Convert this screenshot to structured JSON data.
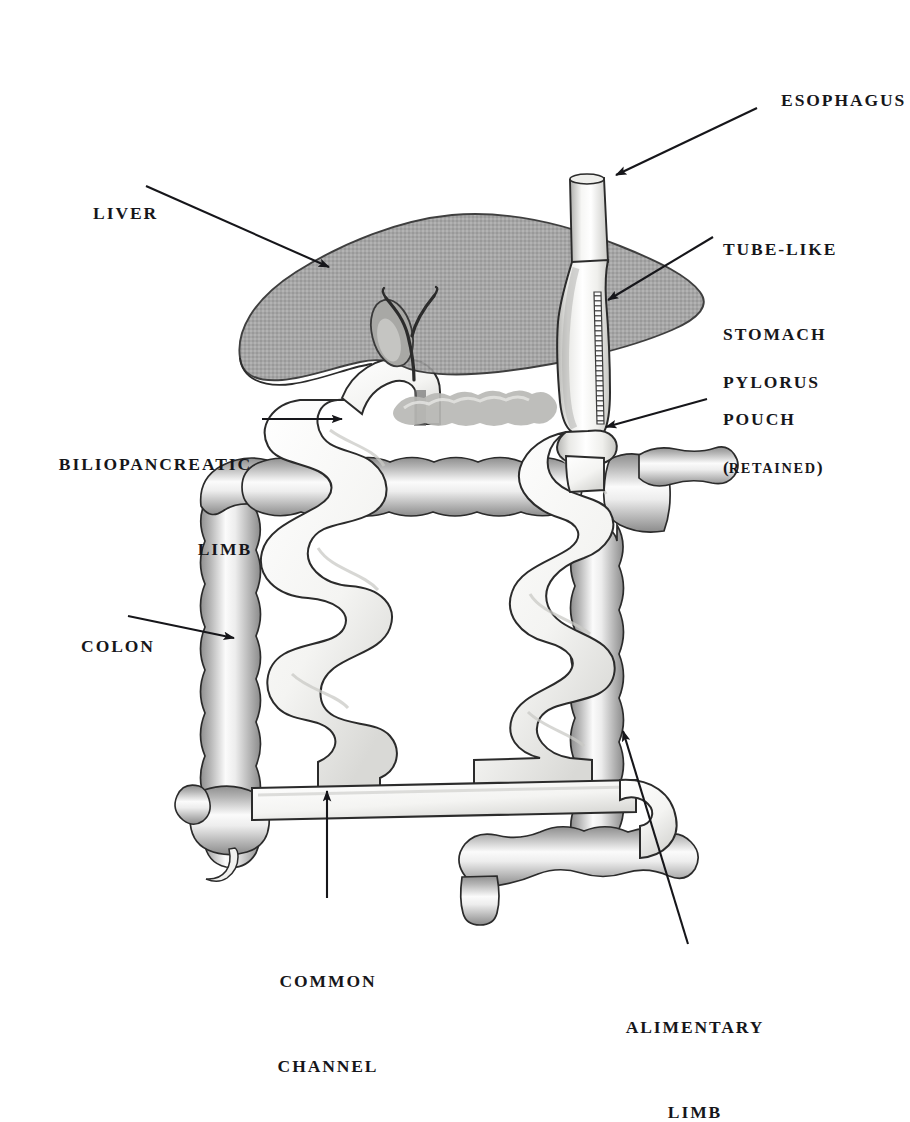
{
  "figure": {
    "background_color": "#ffffff",
    "ink_color": "#16161a",
    "organ_fill": "#f2f2f0",
    "liver_fill": "#9a9a9a",
    "colon_shade": "#b9b9b9"
  },
  "labels": {
    "esophagus": {
      "text": "ESOPHAGUS"
    },
    "tube_like_stomach_pouch": {
      "line1": "TUBE-LIKE",
      "line2": "STOMACH",
      "line3": "POUCH"
    },
    "pylorus": {
      "line1": "PYLORUS",
      "line2_open": "(",
      "line2_small": "RETAINED",
      "line2_close": ")"
    },
    "liver": {
      "text": "LIVER"
    },
    "biliopancreatic_limb": {
      "line1": "BILIOPANCREATIC",
      "line2": "LIMB"
    },
    "colon": {
      "text": "COLON"
    },
    "common_channel": {
      "line1": "COMMON",
      "line2": "CHANNEL"
    },
    "alimentary_limb": {
      "line1": "ALIMENTARY",
      "line2": "LIMB"
    }
  },
  "anatomy_parts": [
    {
      "name": "esophagus",
      "description": "vertical tube entering from top"
    },
    {
      "name": "tube-like-stomach-pouch",
      "description": "sleeve gastrectomy pouch with vertical staple line"
    },
    {
      "name": "staple-line",
      "description": "hatched ladder seam on right of gastric sleeve"
    },
    {
      "name": "pylorus",
      "description": "retained pyloric sphincter below stomach pouch"
    },
    {
      "name": "liver",
      "description": "large gray translucent lobe overlying upper abdomen"
    },
    {
      "name": "gallbladder",
      "description": "small oval sac under liver"
    },
    {
      "name": "bile-duct",
      "description": "Y-shaped duct from liver hilum"
    },
    {
      "name": "duodenal-stump",
      "description": "closed duodenal segment"
    },
    {
      "name": "pancreas",
      "description": "lobulated organ behind stomach"
    },
    {
      "name": "biliopancreatic-limb",
      "description": "smooth small-bowel limb on left"
    },
    {
      "name": "alimentary-limb",
      "description": "smooth small-bowel limb on right"
    },
    {
      "name": "common-channel",
      "description": "short distal shared bowel segment"
    },
    {
      "name": "colon",
      "description": "haustrated large bowel frame"
    },
    {
      "name": "cecum",
      "description": "colon pouch lower left"
    },
    {
      "name": "appendix",
      "description": "small worm-like projection off cecum"
    },
    {
      "name": "sigmoid-rectum",
      "description": "lower right colon outflow"
    }
  ],
  "arrows": [
    {
      "name": "arrow-esophagus",
      "from": [
        757,
        108
      ],
      "to": [
        614,
        176
      ]
    },
    {
      "name": "arrow-stomach-pouch",
      "from": [
        713,
        237
      ],
      "to": [
        606,
        300
      ]
    },
    {
      "name": "arrow-pylorus",
      "from": [
        707,
        399
      ],
      "to": [
        604,
        427
      ]
    },
    {
      "name": "arrow-liver",
      "from": [
        146,
        186
      ],
      "to": [
        327,
        266
      ]
    },
    {
      "name": "arrow-biliopancreatic-limb",
      "from": [
        262,
        419
      ],
      "to": [
        340,
        419
      ]
    },
    {
      "name": "arrow-colon",
      "from": [
        128,
        616
      ],
      "to": [
        232,
        637
      ]
    },
    {
      "name": "arrow-common-channel",
      "from": [
        327,
        898
      ],
      "to": [
        327,
        793
      ]
    },
    {
      "name": "arrow-alimentary-limb",
      "from": [
        688,
        944
      ],
      "to": [
        622,
        729
      ]
    }
  ]
}
